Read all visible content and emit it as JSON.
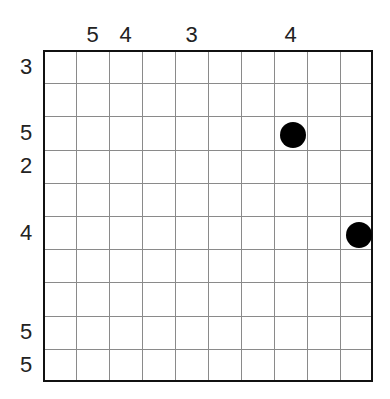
{
  "puzzle": {
    "rows": 10,
    "cols": 10,
    "column_clues": [
      {
        "col": 1,
        "value": "5"
      },
      {
        "col": 2,
        "value": "4"
      },
      {
        "col": 4,
        "value": "3"
      },
      {
        "col": 7,
        "value": "4"
      }
    ],
    "row_clues": [
      {
        "row": 0,
        "value": "3"
      },
      {
        "row": 2,
        "value": "5"
      },
      {
        "row": 3,
        "value": "2"
      },
      {
        "row": 5,
        "value": "4"
      },
      {
        "row": 8,
        "value": "5"
      },
      {
        "row": 9,
        "value": "5"
      }
    ],
    "pieces": [
      {
        "row": 2,
        "col": 7,
        "type": "black-dot"
      },
      {
        "row": 5,
        "col": 9,
        "type": "black-dot"
      }
    ]
  },
  "colors": {
    "grid": "#8a8a8a",
    "border": "#111111",
    "dot": "#000000"
  }
}
